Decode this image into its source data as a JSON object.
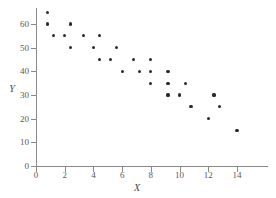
{
  "chart_data": {
    "type": "scatter",
    "title": "",
    "xlabel": "X",
    "ylabel": "Y",
    "xlim": [
      0,
      16
    ],
    "ylim": [
      0,
      68
    ],
    "grid": false,
    "legend": null,
    "xticks": [
      0,
      2,
      4,
      6,
      8,
      10,
      12,
      14
    ],
    "yticks": [
      0,
      10,
      20,
      30,
      40,
      50,
      60
    ],
    "marker": "filled-circle",
    "marker_color": "#2b2b2b",
    "points": [
      {
        "x": 0.8,
        "y": 65
      },
      {
        "x": 0.8,
        "y": 60
      },
      {
        "x": 1.2,
        "y": 55
      },
      {
        "x": 2.0,
        "y": 55
      },
      {
        "x": 2.4,
        "y": 60
      },
      {
        "x": 2.4,
        "y": 50
      },
      {
        "x": 3.3,
        "y": 55
      },
      {
        "x": 4.0,
        "y": 50
      },
      {
        "x": 4.4,
        "y": 55
      },
      {
        "x": 4.4,
        "y": 45
      },
      {
        "x": 5.2,
        "y": 45
      },
      {
        "x": 5.6,
        "y": 50
      },
      {
        "x": 6.0,
        "y": 40
      },
      {
        "x": 6.8,
        "y": 45
      },
      {
        "x": 7.2,
        "y": 40
      },
      {
        "x": 8.0,
        "y": 45
      },
      {
        "x": 8.0,
        "y": 40
      },
      {
        "x": 8.0,
        "y": 35
      },
      {
        "x": 9.2,
        "y": 40
      },
      {
        "x": 9.2,
        "y": 35
      },
      {
        "x": 9.2,
        "y": 30
      },
      {
        "x": 10.0,
        "y": 30
      },
      {
        "x": 10.4,
        "y": 35
      },
      {
        "x": 10.8,
        "y": 25
      },
      {
        "x": 12.0,
        "y": 20
      },
      {
        "x": 12.4,
        "y": 30
      },
      {
        "x": 12.8,
        "y": 25
      },
      {
        "x": 14.0,
        "y": 15
      }
    ]
  },
  "axes": {
    "x_title": "X",
    "y_title": "Y",
    "x_tick_labels": [
      "0",
      "2",
      "4",
      "6",
      "8",
      "10",
      "12",
      "14"
    ],
    "y_tick_labels": [
      "0",
      "10",
      "20",
      "30",
      "40",
      "50",
      "60"
    ]
  },
  "colors": {
    "marker": "#2b2b2b",
    "axis": "#8a8a8a",
    "tick_text": "#59595b",
    "background": "#ffffff"
  }
}
